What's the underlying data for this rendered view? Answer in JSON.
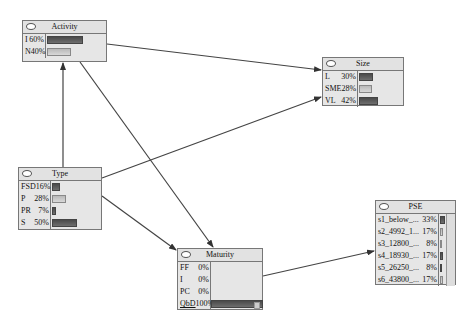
{
  "nodes": {
    "activity": {
      "title": "Activity",
      "states": [
        {
          "label": "I",
          "pct": "60%",
          "value": 60
        },
        {
          "label": "N",
          "pct": "40%",
          "value": 40
        }
      ]
    },
    "size": {
      "title": "Size",
      "states": [
        {
          "label": "L",
          "pct": "30%",
          "value": 30
        },
        {
          "label": "SME",
          "pct": "28%",
          "value": 28
        },
        {
          "label": "VL",
          "pct": "42%",
          "value": 42
        }
      ]
    },
    "type": {
      "title": "Type",
      "states": [
        {
          "label": "FSD",
          "pct": "16%",
          "value": 16
        },
        {
          "label": "P",
          "pct": "28%",
          "value": 28
        },
        {
          "label": "PR",
          "pct": "7%",
          "value": 7
        },
        {
          "label": "S",
          "pct": "50%",
          "value": 50
        }
      ]
    },
    "maturity": {
      "title": "Maturity",
      "states": [
        {
          "label": "FF",
          "pct": "0%",
          "value": 0
        },
        {
          "label": "I",
          "pct": "0%",
          "value": 0
        },
        {
          "label": "PC",
          "pct": "0%",
          "value": 0
        },
        {
          "label": "QbD",
          "pct": "100%",
          "value": 100
        }
      ]
    },
    "pse": {
      "title": "PSE",
      "states": [
        {
          "label": "s1_below_...",
          "pct": "33%",
          "value": 33
        },
        {
          "label": "s2_4992_1...",
          "pct": "17%",
          "value": 17
        },
        {
          "label": "s3_12800_...",
          "pct": "8%",
          "value": 8
        },
        {
          "label": "s4_18930_...",
          "pct": "17%",
          "value": 17
        },
        {
          "label": "s5_26250_...",
          "pct": "8%",
          "value": 8
        },
        {
          "label": "s6_43800_...",
          "pct": "17%",
          "value": 17
        }
      ]
    }
  },
  "edges": [
    {
      "from": "Type",
      "to": "Activity"
    },
    {
      "from": "Activity",
      "to": "Size"
    },
    {
      "from": "Activity",
      "to": "Maturity"
    },
    {
      "from": "Type",
      "to": "Size"
    },
    {
      "from": "Type",
      "to": "Maturity"
    },
    {
      "from": "Maturity",
      "to": "PSE"
    }
  ]
}
